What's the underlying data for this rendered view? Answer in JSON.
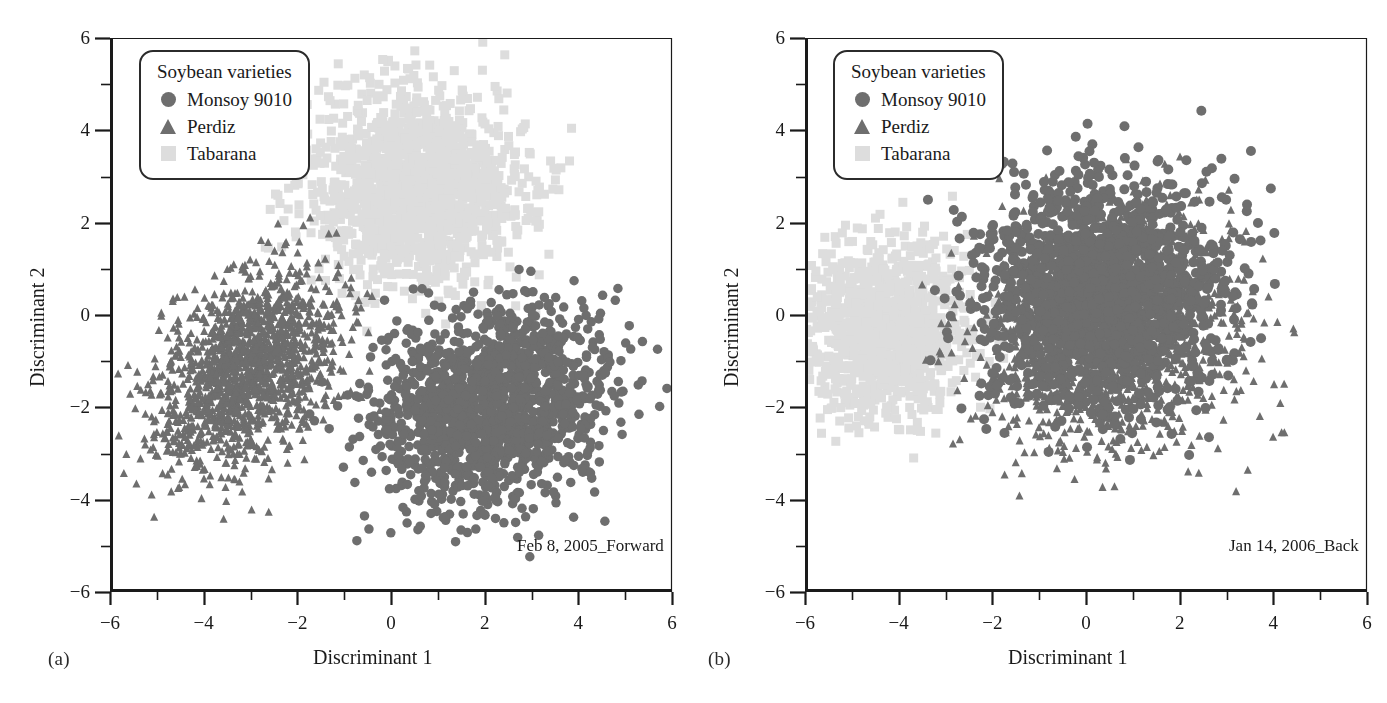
{
  "figure": {
    "panels": [
      {
        "letter": "(a)",
        "corner_note": "Feb 8, 2005_Forward",
        "legend_title": "Soybean varieties",
        "xlabel": "Discriminant 1",
        "ylabel": "Discriminant 2"
      },
      {
        "letter": "(b)",
        "corner_note": "Jan 14, 2006_Back",
        "legend_title": "Soybean varieties",
        "xlabel": "Discriminant 1",
        "ylabel": "Discriminant 2"
      }
    ],
    "legend_entries": [
      {
        "label": "Monsoy 9010",
        "marker": "circle",
        "color": "#6e6e6e"
      },
      {
        "label": "Perdiz",
        "marker": "triangle",
        "color": "#6e6e6e"
      },
      {
        "label": "Tabarana",
        "marker": "square",
        "color": "#dddddd"
      }
    ]
  },
  "chart_data": [
    {
      "type": "scatter",
      "title": "Feb 8, 2005_Forward",
      "panel": "(a)",
      "xlabel": "Discriminant 1",
      "ylabel": "Discriminant 2",
      "xlim": [
        -6,
        6
      ],
      "ylim": [
        -6,
        6
      ],
      "xticks": [
        -6,
        -4,
        -2,
        0,
        2,
        4,
        6
      ],
      "yticks": [
        -6,
        -4,
        -2,
        0,
        2,
        4,
        6
      ],
      "xtick_labels": [
        "−6",
        "−4",
        "−2",
        "0",
        "2",
        "4",
        "6"
      ],
      "ytick_labels": [
        "−6",
        "−4",
        "−2",
        "0",
        "2",
        "4",
        "6"
      ],
      "minor_tick_step": 1,
      "grid": false,
      "legend_position": "top-left inside",
      "series": [
        {
          "name": "Monsoy 9010",
          "marker": "circle",
          "color": "#6e6e6e",
          "n_points": 1500,
          "center": [
            2.1,
            -2.0
          ],
          "spread": [
            1.25,
            1.05
          ],
          "correlation": 0.15,
          "marker_size": 9.5
        },
        {
          "name": "Perdiz",
          "marker": "triangle",
          "color": "#6e6e6e",
          "n_points": 1500,
          "center": [
            -3.05,
            -1.15
          ],
          "spread": [
            0.98,
            1.08
          ],
          "correlation": 0.45,
          "marker_size": 8.5
        },
        {
          "name": "Tabarana",
          "marker": "square",
          "color": "#dddddd",
          "n_points": 1600,
          "center": [
            0.55,
            2.75
          ],
          "spread": [
            1.12,
            1.02
          ],
          "correlation": -0.05,
          "marker_size": 9
        }
      ]
    },
    {
      "type": "scatter",
      "title": "Jan 14, 2006_Back",
      "panel": "(b)",
      "xlabel": "Discriminant 1",
      "ylabel": "Discriminant 2",
      "xlim": [
        -6,
        6
      ],
      "ylim": [
        -6,
        6
      ],
      "xticks": [
        -6,
        -4,
        -2,
        0,
        2,
        4,
        6
      ],
      "yticks": [
        -6,
        -4,
        -2,
        0,
        2,
        4,
        6
      ],
      "xtick_labels": [
        "−6",
        "−4",
        "−2",
        "0",
        "2",
        "4",
        "6"
      ],
      "ytick_labels": [
        "−6",
        "−4",
        "−2",
        "0",
        "2",
        "4",
        "6"
      ],
      "minor_tick_step": 1,
      "grid": false,
      "legend_position": "top-left inside",
      "series": [
        {
          "name": "Monsoy 9010",
          "marker": "circle",
          "color": "#6e6e6e",
          "n_points": 1700,
          "center": [
            0.35,
            0.55
          ],
          "spread": [
            1.25,
            1.25
          ],
          "correlation": 0.05,
          "marker_size": 10
        },
        {
          "name": "Perdiz",
          "marker": "triangle",
          "color": "#6e6e6e",
          "n_points": 1500,
          "center": [
            0.55,
            -0.35
          ],
          "spread": [
            1.35,
            1.25
          ],
          "correlation": 0.1,
          "marker_size": 8.5
        },
        {
          "name": "Tabarana",
          "marker": "square",
          "color": "#dddddd",
          "n_points": 1100,
          "center": [
            -4.25,
            -0.3
          ],
          "spread": [
            0.85,
            0.95
          ],
          "correlation": 0.0,
          "marker_size": 9
        }
      ]
    }
  ]
}
